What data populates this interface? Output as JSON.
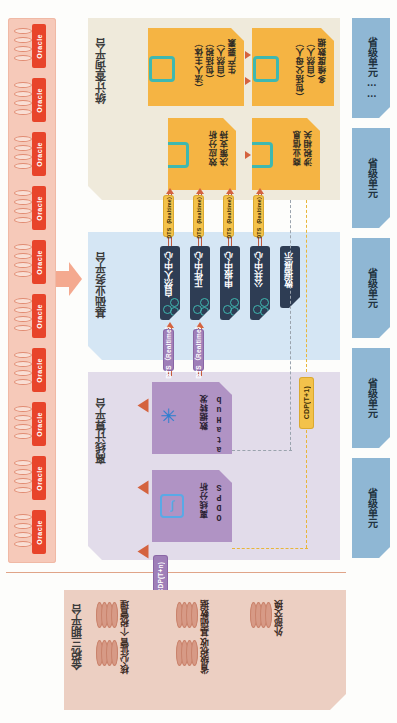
{
  "diagram": {
    "orientation": "rotated-90"
  },
  "colors": {
    "oracle_strip": "#f6c9b9",
    "oracle_tag": "#e8442a",
    "stat_panel": "#efeadb",
    "basic_panel": "#d5e6f4",
    "offline_panel": "#e2dcea",
    "gt3_panel": "#eccfc2",
    "orange_card": "#f5b443",
    "dark_card": "#2e3d54",
    "purple_card": "#b093c4",
    "provincial_unit": "#8fb7d4",
    "teal_accent": "#3fb8b0",
    "connector": "#c2583c",
    "pill_yellow": "#f3c24b",
    "pill_violet": "#9f7fb8",
    "dashed_yellow": "#e8b63a"
  },
  "oracle": {
    "label": "Oracle",
    "count": 10
  },
  "platforms": {
    "stat": {
      "title": "统计查询平台"
    },
    "basic": {
      "title": "基础业务平台"
    },
    "offline": {
      "title": "离线计算平台"
    },
    "gt3": {
      "title": "金税三期平台"
    }
  },
  "stat_cards": [
    {
      "id": "multi-dim",
      "lines": [
        "多维度数据",
        "（自然人）",
        "（包括父母人）"
      ],
      "icon": "diamond-icon"
    },
    {
      "id": "production",
      "lines": [
        "生产要素",
        "（自然人）",
        "（包括税）",
        "（法人主体）"
      ],
      "icon": "diamond-icon"
    },
    {
      "id": "tax-related",
      "lines": [
        "涉税相关",
        "商业信息"
      ],
      "icon": "diamond-icon"
    },
    {
      "id": "decision",
      "lines": [
        "决策支持",
        "效应分析"
      ],
      "icon": "diamond-icon"
    }
  ],
  "basic_cards": [
    {
      "id": "natural-person",
      "label": "自然人中心",
      "icon": "nodes-icon"
    },
    {
      "id": "subject",
      "label": "正件中心",
      "icon": "nodes-icon"
    },
    {
      "id": "declare",
      "label": "申报中心",
      "icon": "nodes-icon"
    },
    {
      "id": "public",
      "label": "公共中心",
      "icon": "nodes-icon"
    },
    {
      "id": "display",
      "label": "数据展示",
      "icon": "nodes-icon"
    }
  ],
  "offline_cards": [
    {
      "id": "datahub",
      "title": "DataHub",
      "subtitle": "数据转发",
      "icon": "hub-star-icon"
    },
    {
      "id": "odps",
      "title": "ODPS",
      "subtitle": "离线分析",
      "icon": "odps-icon"
    }
  ],
  "gt3_items": [
    {
      "id": "core-collect",
      "label": "核心征管",
      "icon": "disc-stack-icon"
    },
    {
      "id": "personal-tax",
      "label": "个税管理",
      "icon": "disc-stack-icon"
    },
    {
      "id": "prov-revenue",
      "label": "省级税收",
      "icon": "disc-stack-icon"
    },
    {
      "id": "basic-data",
      "label": "基础数据",
      "icon": "disc-stack-icon"
    },
    {
      "id": "external-exchange",
      "label": "外部交换",
      "icon": "disc-stack-icon"
    }
  ],
  "provincial_units": [
    {
      "label": "省级单元"
    },
    {
      "label": "省级单元"
    },
    {
      "label": "省级单元"
    },
    {
      "label": "省级单元"
    },
    {
      "label": "省级单元……"
    }
  ],
  "connector_labels": {
    "realtime": "DTS（Realtime）",
    "cdp_t1": "CDP(T+1)",
    "cdp_tn": "CDP(T+n)"
  }
}
